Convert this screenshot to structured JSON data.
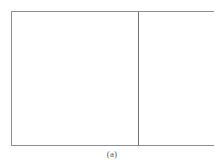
{
  "figure": {
    "caption": "(a)",
    "frame": {
      "border_color": "#8e8e8e",
      "fill_color": "#ffffff"
    },
    "divider": {
      "color": "#6f6f6f"
    },
    "panels": [
      {
        "name": "left-panel",
        "content": ""
      },
      {
        "name": "right-panel",
        "content": ""
      }
    ]
  },
  "page": {
    "background_color": "#ffffff",
    "caption_color": "#5a5a5a"
  }
}
